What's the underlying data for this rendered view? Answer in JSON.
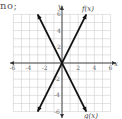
{
  "prefix_text": "no;",
  "chart_data": {
    "type": "line",
    "title": "",
    "xlabel": "x",
    "ylabel": "y",
    "xlim": [
      -6,
      6
    ],
    "ylim": [
      -6,
      6
    ],
    "grid": true,
    "x_ticks": [
      "-6",
      "-4",
      "-2",
      "2",
      "4",
      "6"
    ],
    "y_ticks": [
      "6",
      "4",
      "2",
      "-2",
      "-4",
      "-6"
    ],
    "series": [
      {
        "name": "f(x)",
        "x": [
          -3,
          3
        ],
        "y": [
          -6,
          6
        ],
        "equation": "f(x) = 2x"
      },
      {
        "name": "g(x)",
        "x": [
          -3,
          3
        ],
        "y": [
          6,
          -6
        ],
        "equation": "g(x) = -2x"
      }
    ],
    "annotations": [
      "f(x)",
      "g(x)"
    ]
  },
  "labels": {
    "x_axis": "x",
    "y_axis": "y",
    "f": "f(x)",
    "g": "g(x)"
  },
  "colors": {
    "line": "#111111",
    "grid": "#cfcfcf",
    "axis": "#333333"
  }
}
